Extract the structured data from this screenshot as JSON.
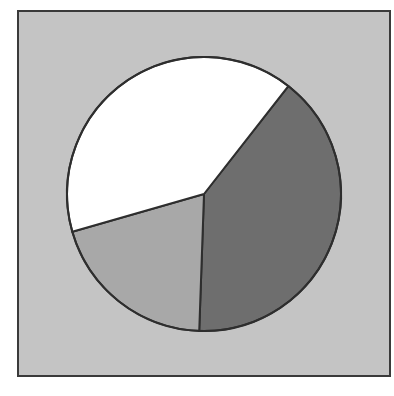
{
  "chart_data": {
    "type": "pie",
    "title": "",
    "labels": [
      "Slice A",
      "Slice B",
      "Slice C"
    ],
    "values": [
      40,
      20,
      40
    ],
    "start_angle_deg": 38,
    "direction": "clockwise",
    "colors": [
      "#6e6e6e",
      "#a8a8a8",
      "#ffffff"
    ],
    "legend": null,
    "background": "#c4c4c4",
    "outline_color": "#2e2e2e",
    "center": [
      204,
      194
    ],
    "radius": 137
  }
}
